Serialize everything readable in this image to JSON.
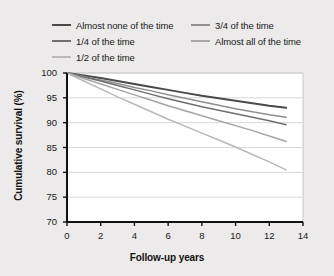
{
  "chart_data": {
    "type": "line",
    "title": "",
    "xlabel": "Follow-up years",
    "ylabel": "Cumulative survival (%)",
    "xlim": [
      0,
      14
    ],
    "ylim": [
      70,
      100
    ],
    "xticks": [
      0,
      2,
      4,
      6,
      8,
      10,
      12,
      14
    ],
    "yticks": [
      70,
      75,
      80,
      85,
      90,
      95,
      100
    ],
    "grid": "horizontal",
    "legend_position": "top",
    "legend_columns": 2,
    "x": [
      0,
      1,
      2,
      3,
      4,
      5,
      6,
      7,
      8,
      9,
      10,
      11,
      12,
      13
    ],
    "series": [
      {
        "name": "Almost none of the time",
        "color": "#4a4a4a",
        "values": [
          100,
          99.5,
          99.0,
          98.4,
          97.8,
          97.2,
          96.6,
          96.0,
          95.4,
          94.9,
          94.4,
          93.9,
          93.4,
          93.0
        ]
      },
      {
        "name": "3/4 of the time",
        "color": "#8f8f8f",
        "values": [
          100,
          99.3,
          98.6,
          97.9,
          97.1,
          96.4,
          95.6,
          94.9,
          94.2,
          93.5,
          92.8,
          92.2,
          91.6,
          91.1
        ]
      },
      {
        "name": "1/4 of the time",
        "color": "#6f6f6f",
        "values": [
          100,
          99.2,
          98.4,
          97.5,
          96.6,
          95.7,
          94.8,
          94.0,
          93.2,
          92.5,
          91.8,
          91.1,
          90.4,
          89.6
        ]
      },
      {
        "name": "Almost all of the time",
        "color": "#a5a5a5",
        "values": [
          100,
          98.9,
          97.8,
          96.7,
          95.6,
          94.5,
          93.4,
          92.4,
          91.4,
          90.4,
          89.4,
          88.4,
          87.3,
          86.2
        ]
      },
      {
        "name": "1/2 of the time",
        "color": "#b8b8b8",
        "values": [
          100,
          98.4,
          96.8,
          95.2,
          93.7,
          92.2,
          90.7,
          89.3,
          87.9,
          86.5,
          85.1,
          83.6,
          82.1,
          80.5
        ]
      }
    ],
    "legend_order": [
      "Almost none of the time",
      "3/4 of the time",
      "1/4 of the time",
      "Almost all of the time",
      "1/2 of the time"
    ],
    "colors": {
      "background": "#eceaea",
      "plot_background": "#ffffff",
      "axis": "#111111",
      "gridline": "#d8d8d8",
      "text": "#1a1a1a"
    }
  }
}
